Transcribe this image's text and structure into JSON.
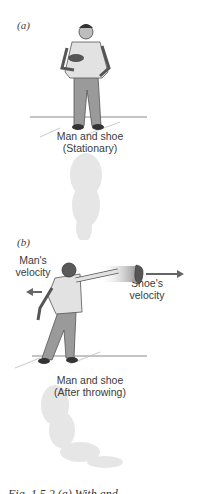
{
  "figure": {
    "panel_a": {
      "label": "(a)",
      "caption_line1": "Man and shoe",
      "caption_line2": "(Stationary)"
    },
    "panel_b": {
      "label": "(b)",
      "man_velocity_line1": "Man's",
      "man_velocity_line2": "velocity",
      "shoe_velocity_line1": "Shoe's",
      "shoe_velocity_line2": "velocity",
      "caption_line1": "Man and shoe",
      "caption_line2": "(After throwing)"
    },
    "figure_caption": "Fig. 1.5.2 (a) With and ...",
    "colors": {
      "ground_line": "#8a8a8a",
      "arrow": "#666666",
      "shadow": "#e4e4e4",
      "figure_fill": "#c8c8c8",
      "figure_dark": "#6a6a6a"
    }
  }
}
